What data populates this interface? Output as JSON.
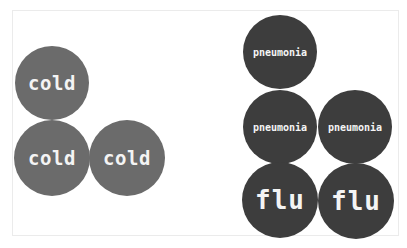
{
  "figure": {
    "groups": [
      {
        "name": "left-cluster",
        "color": "#6b6b6b",
        "circles": [
          {
            "label": "cold",
            "cx": 52,
            "cy": 83,
            "r": 37,
            "size": "big"
          },
          {
            "label": "cold",
            "cx": 52,
            "cy": 158,
            "r": 38,
            "size": "big"
          },
          {
            "label": "cold",
            "cx": 127,
            "cy": 158,
            "r": 38,
            "size": "big"
          }
        ]
      },
      {
        "name": "right-cluster",
        "color": "#3d3d3d",
        "circles": [
          {
            "label": "pneumonia",
            "cx": 280,
            "cy": 52,
            "r": 37,
            "size": "small"
          },
          {
            "label": "pneumonia",
            "cx": 280,
            "cy": 127,
            "r": 37,
            "size": "small"
          },
          {
            "label": "pneumonia",
            "cx": 355,
            "cy": 127,
            "r": 37,
            "size": "small"
          },
          {
            "label": "flu",
            "cx": 280,
            "cy": 200,
            "r": 38,
            "size": "huge"
          },
          {
            "label": "flu",
            "cx": 356,
            "cy": 201,
            "r": 38,
            "size": "huge"
          }
        ]
      }
    ]
  }
}
